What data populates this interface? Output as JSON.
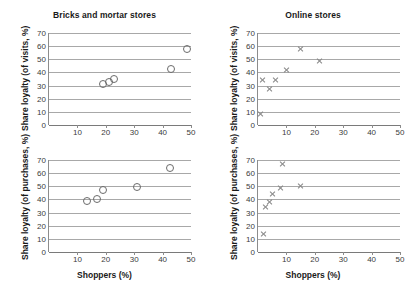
{
  "chart_data": [
    {
      "id": "bricks-visits",
      "type": "scatter",
      "title": "Bricks and mortar stores",
      "xlabel": "",
      "ylabel": "Share loyalty (of visits, %)",
      "xlim": [
        0,
        50
      ],
      "ylim": [
        0,
        70
      ],
      "xticks": [
        10,
        20,
        30,
        40,
        50
      ],
      "yticks": [
        0,
        10,
        20,
        30,
        40,
        50,
        60,
        70
      ],
      "grid": true,
      "legend": "none",
      "marker": "open-circle",
      "points": [
        {
          "x": 19.0,
          "y": 31.5
        },
        {
          "x": 21.0,
          "y": 32.5
        },
        {
          "x": 23.0,
          "y": 35.0
        },
        {
          "x": 43.0,
          "y": 42.5
        },
        {
          "x": 48.5,
          "y": 57.5
        }
      ]
    },
    {
      "id": "online-visits",
      "type": "scatter",
      "title": "Online stores",
      "xlabel": "",
      "ylabel": "Share loyalty (of visits, %)",
      "xlim": [
        0,
        50
      ],
      "ylim": [
        0,
        70
      ],
      "xticks": [
        10,
        20,
        30,
        40,
        50
      ],
      "yticks": [
        0,
        10,
        20,
        30,
        40,
        50,
        60,
        70
      ],
      "grid": true,
      "legend": "none",
      "marker": "cross",
      "points": [
        {
          "x": 1.0,
          "y": 8.5
        },
        {
          "x": 1.5,
          "y": 34.5
        },
        {
          "x": 4.0,
          "y": 27.5
        },
        {
          "x": 6.0,
          "y": 34.5
        },
        {
          "x": 10.0,
          "y": 41.5
        },
        {
          "x": 15.0,
          "y": 58.0
        },
        {
          "x": 21.5,
          "y": 48.5
        }
      ]
    },
    {
      "id": "bricks-purchases",
      "type": "scatter",
      "title": "",
      "xlabel": "Shoppers (%)",
      "ylabel": "Share loyalty (of purchases, %)",
      "xlim": [
        0,
        50
      ],
      "ylim": [
        0,
        70
      ],
      "xticks": [
        10,
        20,
        30,
        40,
        50
      ],
      "yticks": [
        0,
        10,
        20,
        30,
        40,
        50,
        60,
        70
      ],
      "grid": true,
      "legend": "none",
      "marker": "open-circle",
      "points": [
        {
          "x": 13.5,
          "y": 38.5
        },
        {
          "x": 17.0,
          "y": 40.5
        },
        {
          "x": 19.0,
          "y": 47.5
        },
        {
          "x": 31.0,
          "y": 49.5
        },
        {
          "x": 42.5,
          "y": 64.0
        }
      ]
    },
    {
      "id": "online-purchases",
      "type": "scatter",
      "title": "",
      "xlabel": "Shoppers (%)",
      "ylabel": "Share loyalty (of purchases, %)",
      "xlim": [
        0,
        50
      ],
      "ylim": [
        0,
        70
      ],
      "xticks": [
        10,
        20,
        30,
        40,
        50
      ],
      "yticks": [
        0,
        10,
        20,
        30,
        40,
        50,
        60,
        70
      ],
      "grid": true,
      "legend": "none",
      "marker": "cross",
      "points": [
        {
          "x": 2.0,
          "y": 14.0
        },
        {
          "x": 2.5,
          "y": 34.5
        },
        {
          "x": 4.0,
          "y": 38.0
        },
        {
          "x": 5.0,
          "y": 44.0
        },
        {
          "x": 8.0,
          "y": 48.5
        },
        {
          "x": 8.5,
          "y": 67.0
        },
        {
          "x": 15.0,
          "y": 50.0
        }
      ]
    }
  ],
  "panels": {
    "top_left": {
      "title": "Bricks and mortar stores",
      "ylabel": "Share loyalty (of visits, %)",
      "xlabel": ""
    },
    "top_right": {
      "title": "Online stores",
      "ylabel": "Share loyalty (of visits, %)",
      "xlabel": ""
    },
    "bottom_left": {
      "title": "",
      "ylabel": "Share loyalty (of purchases, %)",
      "xlabel": "Shoppers (%)"
    },
    "bottom_right": {
      "title": "",
      "ylabel": "Share loyalty (of purchases, %)",
      "xlabel": "Shoppers (%)"
    }
  },
  "colors": {
    "gridline": "#a8a8a8",
    "axis": "#7a7a7a",
    "circle_marker": "#6b6b6b",
    "cross_marker": "#8a8a8a",
    "text": "#1a1a1a",
    "tick_text": "#3b3b3b"
  }
}
